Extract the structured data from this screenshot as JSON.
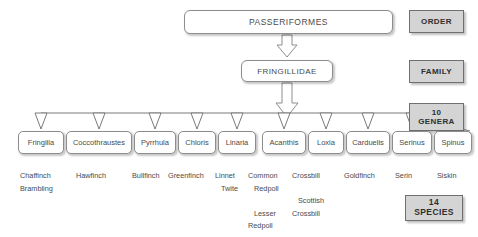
{
  "diagram": {
    "title_order": "PASSERIFORMES",
    "title_family": "FRINGILLIDAE",
    "ranks": {
      "order_label": "ORDER",
      "family_label": "FAMILY",
      "genera_count": "10",
      "genera_label": "GENERA",
      "species_count": "14",
      "species_label": "SPECIES"
    },
    "genera": [
      {
        "name": "Fringilla",
        "left": 18,
        "width": 46,
        "species": [
          "Chaffinch",
          "Brambling"
        ]
      },
      {
        "name": "Coccothraustes",
        "left": 66,
        "width": 66,
        "species": [
          "Hawfinch"
        ]
      },
      {
        "name": "Pyrrhula",
        "left": 134,
        "width": 42,
        "species": [
          "Bullfinch"
        ]
      },
      {
        "name": "Chloris",
        "left": 178,
        "width": 38,
        "species": [
          "Greenfinch"
        ]
      },
      {
        "name": "Linaria",
        "left": 218,
        "width": 38,
        "species": [
          "Linnet",
          "Twite"
        ]
      },
      {
        "name": "Acanthis",
        "left": 262,
        "width": 44,
        "species": [
          "Common",
          "Redpoll",
          "Lesser",
          "Redpoll"
        ]
      },
      {
        "name": "Loxia",
        "left": 308,
        "width": 36,
        "species": [
          "Crossbill",
          "Scottish",
          "Crossbill"
        ]
      },
      {
        "name": "Carduelis",
        "left": 346,
        "width": 44,
        "species": [
          "Goldfinch"
        ]
      },
      {
        "name": "Serinus",
        "left": 392,
        "width": 40,
        "species": [
          "Serin"
        ]
      },
      {
        "name": "Spinus",
        "left": 434,
        "width": 38,
        "species": [
          "Siskin"
        ]
      }
    ],
    "species_columns": [
      {
        "left": 20,
        "lines": [
          {
            "text": "Chaffinch",
            "indent": false
          },
          {
            "text": "Brambling",
            "indent": false
          }
        ]
      },
      {
        "left": 76,
        "lines": [
          {
            "text": "Hawfinch",
            "indent": false
          }
        ]
      },
      {
        "left": 132,
        "lines": [
          {
            "text": "Bullfinch",
            "indent": false
          }
        ]
      },
      {
        "left": 168,
        "lines": [
          {
            "text": "Greenfinch",
            "indent": false
          }
        ]
      },
      {
        "left": 215,
        "lines": [
          {
            "text": "Linnet",
            "indent": false
          },
          {
            "text": "Twite",
            "indent": true
          }
        ]
      },
      {
        "left": 248,
        "lines": [
          {
            "text": "Common",
            "indent": false
          },
          {
            "text": "Redpoll",
            "indent": true
          },
          {
            "text": "",
            "indent": false
          },
          {
            "text": "Lesser",
            "indent": true
          },
          {
            "text": "Redpoll",
            "indent": false
          }
        ]
      },
      {
        "left": 292,
        "lines": [
          {
            "text": "Crossbill",
            "indent": false
          },
          {
            "text": "",
            "indent": false
          },
          {
            "text": "Scottish",
            "indent": true
          },
          {
            "text": "Crossbill",
            "indent": false
          }
        ]
      },
      {
        "left": 344,
        "lines": [
          {
            "text": "Goldfinch",
            "indent": false
          }
        ]
      },
      {
        "left": 395,
        "lines": [
          {
            "text": "Serin",
            "indent": false
          }
        ]
      },
      {
        "left": 437,
        "lines": [
          {
            "text": "Siskin",
            "indent": false
          }
        ]
      }
    ],
    "colors": {
      "badge_fill": "#d4d4d4",
      "badge_border": "#6f6f6f",
      "node_border": "#8d8d8d",
      "text": "#4a4a4a",
      "connector": "#7a7a7a"
    }
  }
}
